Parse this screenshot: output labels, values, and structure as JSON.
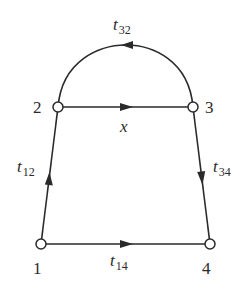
{
  "diagram": {
    "type": "signal-flow-graph",
    "nodes": [
      {
        "id": "1",
        "label": "1",
        "x": 41,
        "y": 244
      },
      {
        "id": "2",
        "label": "2",
        "x": 58,
        "y": 107
      },
      {
        "id": "3",
        "label": "3",
        "x": 193,
        "y": 107
      },
      {
        "id": "4",
        "label": "4",
        "x": 210,
        "y": 244
      }
    ],
    "edges": [
      {
        "from": "1",
        "to": "2",
        "label_main": "t",
        "label_sub": "12"
      },
      {
        "from": "3",
        "to": "2",
        "label_main": "t",
        "label_sub": "32",
        "curved": true
      },
      {
        "from": "2",
        "to": "3",
        "label_main": "x",
        "label_sub": ""
      },
      {
        "from": "3",
        "to": "4",
        "label_main": "t",
        "label_sub": "34"
      },
      {
        "from": "1",
        "to": "4",
        "label_main": "t",
        "label_sub": "14"
      }
    ],
    "colors": {
      "line": "#2a2a2a",
      "node_fill": "#ffffff"
    }
  }
}
